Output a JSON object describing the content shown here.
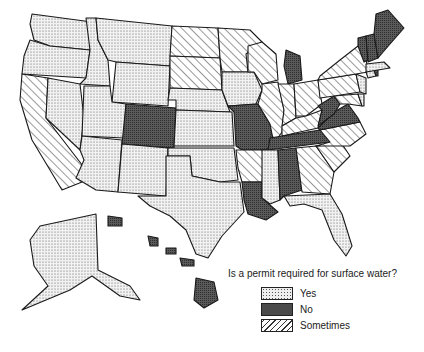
{
  "title": "Is a permit required for surface water?",
  "categories": {
    "yes": {
      "label": "Yes",
      "pattern": "light-dots",
      "color": "#e6e6e6"
    },
    "no": {
      "label": "No",
      "pattern": "dark-dots",
      "color": "#555555"
    },
    "sometimes": {
      "label": "Sometimes",
      "pattern": "diagonal-hatch",
      "color": "#ffffff"
    }
  },
  "legend": [
    {
      "key": "yes",
      "label": "Yes"
    },
    {
      "key": "no",
      "label": "No"
    },
    {
      "key": "sometimes",
      "label": "Sometimes"
    }
  ],
  "states": {
    "WA": "yes",
    "OR": "yes",
    "CA": "sometimes",
    "ID": "yes",
    "NV": "yes",
    "MT": "yes",
    "WY": "yes",
    "UT": "yes",
    "CO": "no",
    "AZ": "yes",
    "NM": "yes",
    "ND": "sometimes",
    "SD": "sometimes",
    "NE": "yes",
    "KS": "yes",
    "OK": "yes",
    "TX": "yes",
    "MN": "sometimes",
    "IA": "yes",
    "MO": "no",
    "AR": "sometimes",
    "LA": "no",
    "WI": "sometimes",
    "IL": "sometimes",
    "MI": "no",
    "IN": "sometimes",
    "OH": "sometimes",
    "KY": "sometimes",
    "TN": "no",
    "MS": "yes",
    "AL": "no",
    "GA": "sometimes",
    "FL": "yes",
    "SC": "sometimes",
    "NC": "sometimes",
    "VA": "no",
    "WV": "no",
    "MD": "sometimes",
    "DE": "yes",
    "PA": "sometimes",
    "NJ": "yes",
    "NY": "sometimes",
    "CT": "yes",
    "RI": "no",
    "MA": "yes",
    "VT": "no",
    "NH": "no",
    "ME": "no",
    "AK": "yes",
    "HI": "no"
  }
}
